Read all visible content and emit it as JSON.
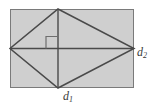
{
  "figure": {
    "canvas": {
      "width": 154,
      "height": 106,
      "background": "#ffffff"
    },
    "colors": {
      "fill": "#cfcfcf",
      "stroke": "#4a4a4a",
      "rectangle_stroke": "#7a7a7a",
      "label": "#3b3b3b",
      "background": "#ffffff"
    },
    "rectangle": {
      "x": 10,
      "y": 9,
      "width": 124,
      "height": 79,
      "fill": "#cfcfcf",
      "stroke": "#7a7a7a"
    },
    "rhombus": {
      "vertices": [
        {
          "name": "top",
          "x": 58,
          "y": 9
        },
        {
          "name": "right",
          "x": 134,
          "y": 48.5
        },
        {
          "name": "bottom",
          "x": 58,
          "y": 88
        },
        {
          "name": "left",
          "x": 10,
          "y": 48.5
        }
      ]
    },
    "diagonals": [
      {
        "id": "d1",
        "orientation": "vertical",
        "from": {
          "x": 58,
          "y": 9
        },
        "to": {
          "x": 58,
          "y": 88
        },
        "label": "d",
        "subscript": "1"
      },
      {
        "id": "d2",
        "orientation": "horizontal",
        "from": {
          "x": 10,
          "y": 48.5
        },
        "to": {
          "x": 134,
          "y": 48.5
        },
        "label": "d",
        "subscript": "2"
      }
    ],
    "right_angle_marker": {
      "x": 46,
      "y": 36.5,
      "size": 12,
      "corner": "upper-left",
      "stroke": "#6e6e6e"
    },
    "labels": {
      "d1": {
        "base": "d",
        "sub": "1",
        "x": 63,
        "y": 90
      },
      "d2": {
        "base": "d",
        "sub": "2",
        "x": 137,
        "y": 46
      }
    }
  }
}
